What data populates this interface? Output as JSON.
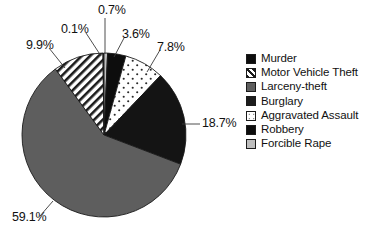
{
  "chart_data": {
    "type": "pie",
    "title": "",
    "categories": [
      "Murder",
      "Motor Vehicle Theft",
      "Larceny-theft",
      "Burglary",
      "Aggravated Assault",
      "Robbery",
      "Forcible Rape"
    ],
    "values": [
      0.1,
      9.9,
      59.1,
      18.7,
      7.8,
      3.6,
      0.7
    ],
    "value_labels": [
      "0.1%",
      "9.9%",
      "59.1%",
      "18.7%",
      "7.8%",
      "3.6%",
      "0.7%"
    ],
    "units": "percent",
    "legend_position": "right",
    "grid": false,
    "slice_order_clockwise_from_top": [
      "Forcible Rape",
      "Robbery",
      "Aggravated Assault",
      "Burglary",
      "Larceny-theft",
      "Motor Vehicle Theft",
      "Murder"
    ],
    "colors": {
      "Murder": "#0d0d0d",
      "Motor Vehicle Theft": "#ffffff",
      "Larceny-theft": "#5e5e5e",
      "Burglary": "#141414",
      "Aggravated Assault": "#ffffff",
      "Robbery": "#0d0d0d",
      "Forcible Rape": "#bdbdbd"
    },
    "patterns": {
      "Murder": "solid",
      "Motor Vehicle Theft": "diagonal-hatch",
      "Larceny-theft": "solid",
      "Burglary": "solid",
      "Aggravated Assault": "dotted",
      "Robbery": "solid",
      "Forcible Rape": "solid"
    }
  },
  "labels": {
    "forcible_rape": "0.7%",
    "murder": "0.1%",
    "robbery": "3.6%",
    "motor_vehicle_theft": "9.9%",
    "aggravated_assault": "7.8%",
    "burglary": "18.7%",
    "larceny_theft": "59.1%"
  },
  "legend": {
    "items": [
      {
        "label": "Murder",
        "pattern": "solid",
        "color": "#0d0d0d"
      },
      {
        "label": "Motor Vehicle Theft",
        "pattern": "diagonal-hatch",
        "color": "#ffffff"
      },
      {
        "label": "Larceny-theft",
        "pattern": "solid",
        "color": "#5e5e5e"
      },
      {
        "label": "Burglary",
        "pattern": "solid",
        "color": "#1c1c1c"
      },
      {
        "label": "Aggravated Assault",
        "pattern": "dotted",
        "color": "#ffffff"
      },
      {
        "label": "Robbery",
        "pattern": "solid",
        "color": "#0d0d0d"
      },
      {
        "label": "Forcible Rape",
        "pattern": "solid",
        "color": "#bdbdbd"
      }
    ]
  }
}
